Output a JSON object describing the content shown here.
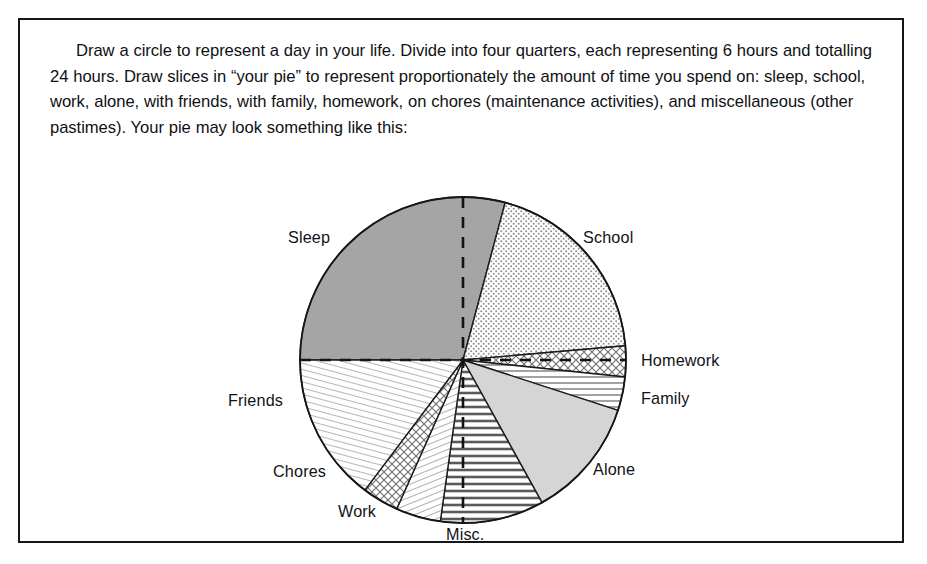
{
  "figure": {
    "instruction_text": "Draw a circle to represent a day in your life. Divide into four quarters, each representing 6 hours and totalling 24 hours. Draw slices in “your pie” to represent proportionately the amount of time you spend on: sleep, school, work, alone, with friends, with family, homework, on chores (maintenance activities), and miscellaneous (other pastimes). Your pie may look something like this:",
    "border_color": "#15161a",
    "background_color": "#ffffff",
    "text_color": "#101114"
  },
  "chart_data": {
    "type": "pie",
    "title": "",
    "subtitle": "",
    "xlabel": "",
    "ylabel": "",
    "units": "hours",
    "total": 24,
    "legend_position": "labels-around-pie",
    "grid": false,
    "quarter_guides": {
      "description": "Dashed vertical and horizontal diameters dividing the circle into four 6-hour quarters",
      "style": "dashed",
      "color": "#121316",
      "angles_deg": [
        0,
        90,
        180,
        270
      ]
    },
    "center": {
      "x": 443,
      "y": 340
    },
    "radius": 163,
    "start_angle_deg": 0,
    "direction": "clockwise",
    "categories": [
      "Sleep",
      "School",
      "Homework",
      "Family",
      "Alone",
      "Misc.",
      "Work",
      "Chores",
      "Friends"
    ],
    "values": [
      7.0,
      4.67,
      0.73,
      0.8,
      2.87,
      2.47,
      1.07,
      0.87,
      3.53
    ],
    "angles_deg": [
      105.0,
      70.0,
      11.0,
      12.0,
      43.0,
      37.0,
      16.0,
      13.0,
      53.0
    ],
    "slices": [
      {
        "label": "Sleep",
        "hours": 7.0,
        "angle_deg": 105,
        "start_deg": 270,
        "end_deg": 15,
        "fill": "solid-dark-gray",
        "color": "#a5a5a5"
      },
      {
        "label": "School",
        "hours": 4.67,
        "angle_deg": 70,
        "start_deg": 15,
        "end_deg": 85,
        "fill": "fine-dots",
        "color": "#f4f4f4"
      },
      {
        "label": "Homework",
        "hours": 0.73,
        "angle_deg": 11,
        "start_deg": 85,
        "end_deg": 96,
        "fill": "crosshatch",
        "color": "#f0f0f0"
      },
      {
        "label": "Family",
        "hours": 0.8,
        "angle_deg": 12,
        "start_deg": 96,
        "end_deg": 108,
        "fill": "horizontal-lines",
        "color": "#fafafa"
      },
      {
        "label": "Alone",
        "hours": 2.87,
        "angle_deg": 43,
        "start_deg": 108,
        "end_deg": 151,
        "fill": "solid-light-gray",
        "color": "#d5d5d5"
      },
      {
        "label": "Misc.",
        "hours": 2.47,
        "angle_deg": 37,
        "start_deg": 151,
        "end_deg": 188,
        "fill": "bold-horizontal",
        "color": "#ededed"
      },
      {
        "label": "Work",
        "hours": 1.07,
        "angle_deg": 16,
        "start_deg": 188,
        "end_deg": 204,
        "fill": "fine-diagonal",
        "color": "#fafafa"
      },
      {
        "label": "Chores",
        "hours": 0.87,
        "angle_deg": 13,
        "start_deg": 204,
        "end_deg": 217,
        "fill": "crosshatch",
        "color": "#f2f2f2"
      },
      {
        "label": "Friends",
        "hours": 3.53,
        "angle_deg": 53,
        "start_deg": 217,
        "end_deg": 270,
        "fill": "fine-diagonal",
        "color": "#f6f6f6"
      }
    ],
    "labels": [
      {
        "text": "Sleep",
        "x": 268,
        "y": 208
      },
      {
        "text": "School",
        "x": 563,
        "y": 208
      },
      {
        "text": "Homework",
        "x": 621,
        "y": 331
      },
      {
        "text": "Family",
        "x": 621,
        "y": 369
      },
      {
        "text": "Alone",
        "x": 573,
        "y": 440
      },
      {
        "text": "Misc.",
        "x": 426,
        "y": 505
      },
      {
        "text": "Work",
        "x": 318,
        "y": 482
      },
      {
        "text": "Chores",
        "x": 253,
        "y": 442
      },
      {
        "text": "Friends",
        "x": 208,
        "y": 371
      }
    ]
  }
}
